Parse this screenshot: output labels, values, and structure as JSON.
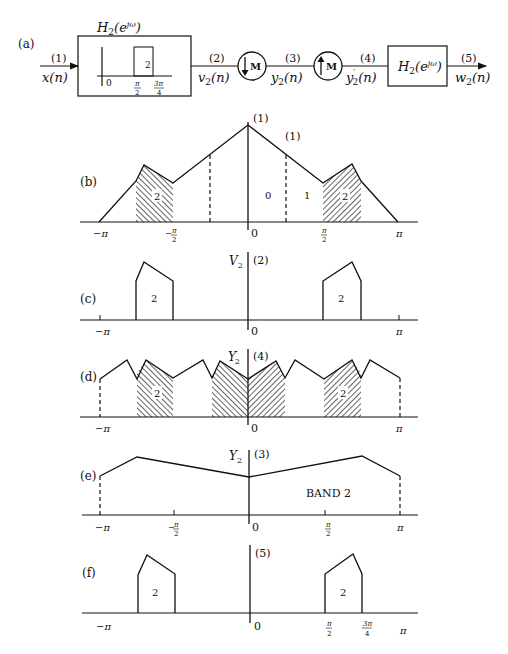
{
  "figure": {
    "panel_a": {
      "label": "(a)",
      "input": {
        "node": "(1)",
        "signal": "x(n)"
      },
      "filter1": {
        "title": "H₂(e^{jω})",
        "title_main": "H",
        "title_sub": "2",
        "title_arg": "(e",
        "title_sup": "jω",
        "title_close": ")",
        "passband_gain": "2",
        "ticks": [
          "0",
          "π/2",
          "3π/4"
        ],
        "tick_num": [
          "π",
          "3π"
        ],
        "tick_den": [
          "2",
          "4"
        ]
      },
      "node2": {
        "node": "(2)",
        "signal": "v₂(n)"
      },
      "downsampler": {
        "label": "M",
        "arrow": "down"
      },
      "node3": {
        "node": "(3)",
        "signal": "y₂(n)"
      },
      "upsampler": {
        "label": "M",
        "arrow": "up"
      },
      "node4": {
        "node": "(4)",
        "signal": "y′₂(n)"
      },
      "filter2": {
        "title": "H₂(e^{jω})"
      },
      "node5": {
        "node": "(5)",
        "signal": "w₂(n)"
      }
    },
    "panel_b": {
      "label": "(b)",
      "node": "(1)",
      "node2": "(1)",
      "band_labels": [
        "2",
        "0",
        "1",
        "2"
      ],
      "ticks": [
        "−π",
        "−π/2",
        "0",
        "π/2",
        "π"
      ]
    },
    "panel_c": {
      "label": "(c)",
      "axis_label": "V₂",
      "node": "(2)",
      "band_labels": [
        "2",
        "2"
      ],
      "ticks": [
        "−π",
        "0",
        "π"
      ]
    },
    "panel_d": {
      "label": "(d)",
      "axis_label": "Y′₂",
      "node": "(4)",
      "band_labels": [
        "2",
        "2"
      ],
      "ticks": [
        "−π",
        "0",
        "π"
      ]
    },
    "panel_e": {
      "label": "(e)",
      "axis_label": "Y₂",
      "node": "(3)",
      "annotation": "BAND 2",
      "ticks": [
        "−π",
        "−π/2",
        "0",
        "π/2",
        "π"
      ]
    },
    "panel_f": {
      "label": "(f)",
      "node": "(5)",
      "band_labels": [
        "2",
        "2"
      ],
      "ticks": [
        "−π",
        "0",
        "π/2",
        "3π/4",
        "π"
      ]
    },
    "sym": {
      "minus_pi": "−π",
      "pi": "π",
      "zero": "0",
      "two": "2",
      "four": "4",
      "minus": "−",
      "three_pi": "3π"
    }
  }
}
